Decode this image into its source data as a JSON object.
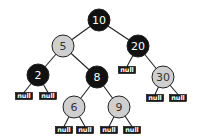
{
  "diagram": {
    "type": "red-black-tree",
    "colors": {
      "black_fill": "#111111",
      "red_fill": "#cfcfcf",
      "outline": "#222222",
      "black_text": "#ffffff",
      "red_text": "#333333",
      "edge": "#222222",
      "null_fill": "#1a1a1a"
    },
    "nodes": [
      {
        "id": "n10",
        "label": "10",
        "color": "black",
        "x": 99,
        "y": 20
      },
      {
        "id": "n5",
        "label": "5",
        "color": "red",
        "x": 63,
        "y": 46
      },
      {
        "id": "n20",
        "label": "20",
        "color": "black",
        "x": 138,
        "y": 46
      },
      {
        "id": "n2",
        "label": "2",
        "color": "black",
        "x": 38,
        "y": 75
      },
      {
        "id": "n8",
        "label": "8",
        "color": "black",
        "x": 97,
        "y": 77
      },
      {
        "id": "n30",
        "label": "30",
        "color": "red",
        "x": 163,
        "y": 77
      },
      {
        "id": "n6",
        "label": "6",
        "color": "red",
        "x": 74,
        "y": 107
      },
      {
        "id": "n9",
        "label": "9",
        "color": "red",
        "x": 119,
        "y": 107
      }
    ],
    "null_label": "null",
    "nulls": [
      {
        "id": "null-2L",
        "parent": "n2",
        "x": 24,
        "y": 96
      },
      {
        "id": "null-2R",
        "parent": "n2",
        "x": 48,
        "y": 96
      },
      {
        "id": "null-20L",
        "parent": "n20",
        "x": 127,
        "y": 70
      },
      {
        "id": "null-30L",
        "parent": "n30",
        "x": 155,
        "y": 98
      },
      {
        "id": "null-30R",
        "parent": "n30",
        "x": 178,
        "y": 98
      },
      {
        "id": "null-6L",
        "parent": "n6",
        "x": 64,
        "y": 130
      },
      {
        "id": "null-6R",
        "parent": "n6",
        "x": 85,
        "y": 130
      },
      {
        "id": "null-9L",
        "parent": "n9",
        "x": 109,
        "y": 130
      },
      {
        "id": "null-9R",
        "parent": "n9",
        "x": 132,
        "y": 130
      }
    ],
    "edges": [
      [
        "n10",
        "n5"
      ],
      [
        "n10",
        "n20"
      ],
      [
        "n5",
        "n2"
      ],
      [
        "n5",
        "n8"
      ],
      [
        "n20",
        "null-20L"
      ],
      [
        "n20",
        "n30"
      ],
      [
        "n8",
        "n6"
      ],
      [
        "n8",
        "n9"
      ],
      [
        "n2",
        "null-2L"
      ],
      [
        "n2",
        "null-2R"
      ],
      [
        "n30",
        "null-30L"
      ],
      [
        "n30",
        "null-30R"
      ],
      [
        "n6",
        "null-6L"
      ],
      [
        "n6",
        "null-6R"
      ],
      [
        "n9",
        "null-9L"
      ],
      [
        "n9",
        "null-9R"
      ]
    ]
  }
}
